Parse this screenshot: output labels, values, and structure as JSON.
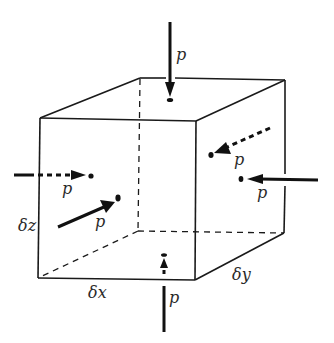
{
  "diagram": {
    "type": "isometric fluid element with pressure forces",
    "element": {
      "shape": "rectangular prism (cube)",
      "dimensions": {
        "x": "δx",
        "y": "δy",
        "z": "δz"
      }
    },
    "forces": [
      {
        "id": "top",
        "label": "p",
        "direction": "downward onto top face",
        "line": "solid"
      },
      {
        "id": "bottom",
        "label": "p",
        "direction": "upward onto bottom face",
        "line": "solid"
      },
      {
        "id": "left-x",
        "label": "p",
        "direction": "rightward onto left face (hidden)",
        "line": "dashed"
      },
      {
        "id": "front-y",
        "label": "p",
        "direction": "inward onto front face",
        "line": "solid"
      },
      {
        "id": "back-y",
        "label": "p",
        "direction": "inward onto back face (hidden)",
        "line": "dashed"
      },
      {
        "id": "right-x",
        "label": "p",
        "direction": "leftward onto right face",
        "line": "solid"
      }
    ],
    "colors": {
      "line": "#1a1a1a",
      "background": "#ffffff"
    }
  }
}
